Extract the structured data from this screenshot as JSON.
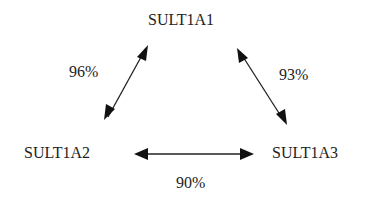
{
  "diagram": {
    "nodes": [
      {
        "id": "SULT1A1",
        "label": "SULT1A1"
      },
      {
        "id": "SULT1A2",
        "label": "SULT1A2"
      },
      {
        "id": "SULT1A3",
        "label": "SULT1A3"
      }
    ],
    "edges": [
      {
        "from": "SULT1A1",
        "to": "SULT1A2",
        "label": "96%",
        "bidirectional": true
      },
      {
        "from": "SULT1A1",
        "to": "SULT1A3",
        "label": "93%",
        "bidirectional": true
      },
      {
        "from": "SULT1A2",
        "to": "SULT1A3",
        "label": "90%",
        "bidirectional": true
      }
    ]
  }
}
